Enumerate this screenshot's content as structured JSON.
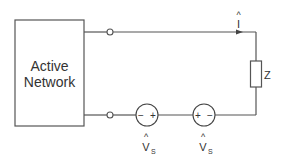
{
  "diagram": {
    "type": "circuit",
    "network_block": {
      "line1": "Active",
      "line2": "Network"
    },
    "current": {
      "symbol": "I",
      "hat": "^"
    },
    "impedance": {
      "label": "Z"
    },
    "sources": [
      {
        "symbol": "V",
        "hat": "^",
        "subscript": "S",
        "left_sign": "−",
        "right_sign": "+"
      },
      {
        "symbol": "V",
        "hat": "^",
        "subscript": "S",
        "left_sign": "+",
        "right_sign": "−"
      }
    ],
    "colors": {
      "line": "#555555",
      "text": "#333333",
      "background": "#ffffff"
    }
  }
}
